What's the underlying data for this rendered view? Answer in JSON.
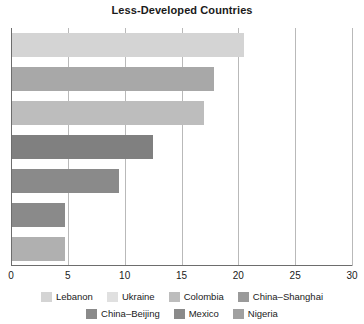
{
  "chart_data": {
    "type": "bar",
    "orientation": "horizontal",
    "title": "Less-Developed Countries",
    "xlabel": "",
    "ylabel": "",
    "xlim": [
      0,
      30
    ],
    "xticks": [
      0,
      5,
      10,
      15,
      20,
      25,
      30
    ],
    "xtick_labels": [
      "0",
      "5",
      "10",
      "15",
      "20",
      "25",
      "30"
    ],
    "grid": true,
    "legend_position": "bottom",
    "categories": [
      "Lebanon",
      "Ukraine",
      "Colombia",
      "China–Shanghai",
      "China–Beijing",
      "Mexico",
      "Nigeria"
    ],
    "values": [
      20.4,
      17.8,
      16.9,
      12.4,
      9.4,
      4.7,
      4.7
    ],
    "colors": [
      "#d4d4d4",
      "#a8a8a8",
      "#bdbdbd",
      "#808080",
      "#8a8a8a",
      "#8a8a8a",
      "#b0b0b0"
    ],
    "bars": [
      {
        "label": "Lebanon",
        "value": 20.4,
        "color": "#d4d4d4"
      },
      {
        "label": "Ukraine",
        "value": 17.8,
        "color": "#a8a8a8"
      },
      {
        "label": "Colombia",
        "value": 16.9,
        "color": "#bdbdbd"
      },
      {
        "label": "China–Shanghai",
        "value": 12.4,
        "color": "#808080"
      },
      {
        "label": "China–Beijing",
        "value": 9.4,
        "color": "#8a8a8a"
      },
      {
        "label": "Mexico",
        "value": 4.7,
        "color": "#8a8a8a"
      },
      {
        "label": "Nigeria",
        "value": 4.7,
        "color": "#b0b0b0"
      }
    ],
    "legend": [
      {
        "label": "Lebanon",
        "color": "#d4d4d4"
      },
      {
        "label": "Ukraine",
        "color": "#e0e0e0"
      },
      {
        "label": "Colombia",
        "color": "#bdbdbd"
      },
      {
        "label": "China–Shanghai",
        "color": "#9a9a9a"
      },
      {
        "label": "China–Beijing",
        "color": "#8a8a8a"
      },
      {
        "label": "Mexico",
        "color": "#8a8a8a"
      },
      {
        "label": "Nigeria",
        "color": "#a0a0a0"
      }
    ]
  }
}
